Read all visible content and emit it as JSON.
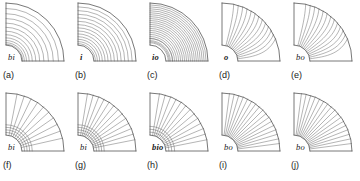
{
  "figure": {
    "background": "#ffffff",
    "line_color": "#6b6b6b",
    "outline_color": "#555555",
    "text_color": "#1a1a1a",
    "rows": 2,
    "columns": 5
  },
  "chart_data": {
    "type": "diagram",
    "title": "",
    "geometry": {
      "shape": "quarter-annulus",
      "center": "bottom-left",
      "inner_radius": 16,
      "outer_radius": 58,
      "angle_start_deg": 0,
      "angle_end_deg": 90
    },
    "panels": [
      {
        "key": "a",
        "panel_label": "(a)",
        "var_label": "bi",
        "bold": false,
        "row": 0,
        "col": 0,
        "line_family": "arcs",
        "count": 11,
        "bias": "inner",
        "spread": 0.34,
        "radial_extra": 0
      },
      {
        "key": "b",
        "panel_label": "(b)",
        "var_label": "i",
        "bold": true,
        "row": 0,
        "col": 1,
        "line_family": "arcs",
        "count": 13,
        "bias": "inner",
        "spread": 0.5,
        "radial_extra": 0
      },
      {
        "key": "c",
        "panel_label": "(c)",
        "var_label": "io",
        "bold": true,
        "row": 0,
        "col": 2,
        "line_family": "arcs",
        "count": 20,
        "bias": "inner-wide",
        "spread": 0.78,
        "radial_extra": 2
      },
      {
        "key": "d",
        "panel_label": "(d)",
        "var_label": "o",
        "bold": true,
        "row": 0,
        "col": 3,
        "line_family": "radial-outer",
        "count": 13,
        "bias": "outer",
        "spread": 0.92,
        "radial_extra": 0
      },
      {
        "key": "e",
        "panel_label": "(e)",
        "var_label": "bo",
        "bold": false,
        "row": 0,
        "col": 4,
        "line_family": "radial-outer",
        "count": 13,
        "bias": "outer",
        "spread": 1.0,
        "radial_extra": 0
      },
      {
        "key": "f",
        "panel_label": "(f)",
        "var_label": "bi",
        "bold": false,
        "row": 1,
        "col": 0,
        "line_family": "fan",
        "count": 10,
        "bias": "upper",
        "spread": 0.55,
        "radial_extra": 4
      },
      {
        "key": "g",
        "panel_label": "(g)",
        "var_label": "bi",
        "bold": false,
        "row": 1,
        "col": 1,
        "line_family": "fan",
        "count": 13,
        "bias": "upper",
        "spread": 0.68,
        "radial_extra": 4
      },
      {
        "key": "h",
        "panel_label": "(h)",
        "var_label": "bio",
        "bold": true,
        "row": 1,
        "col": 2,
        "line_family": "fan",
        "count": 13,
        "bias": "upper",
        "spread": 0.8,
        "radial_extra": 3
      },
      {
        "key": "i",
        "panel_label": "(i)",
        "var_label": "bo",
        "bold": false,
        "row": 1,
        "col": 3,
        "line_family": "fan-full",
        "count": 17,
        "bias": "even",
        "spread": 1.0,
        "radial_extra": 0
      },
      {
        "key": "j",
        "panel_label": "(j)",
        "var_label": "bo",
        "bold": false,
        "row": 1,
        "col": 4,
        "line_family": "fan-full",
        "count": 17,
        "bias": "even",
        "spread": 1.0,
        "radial_extra": 0
      }
    ]
  }
}
